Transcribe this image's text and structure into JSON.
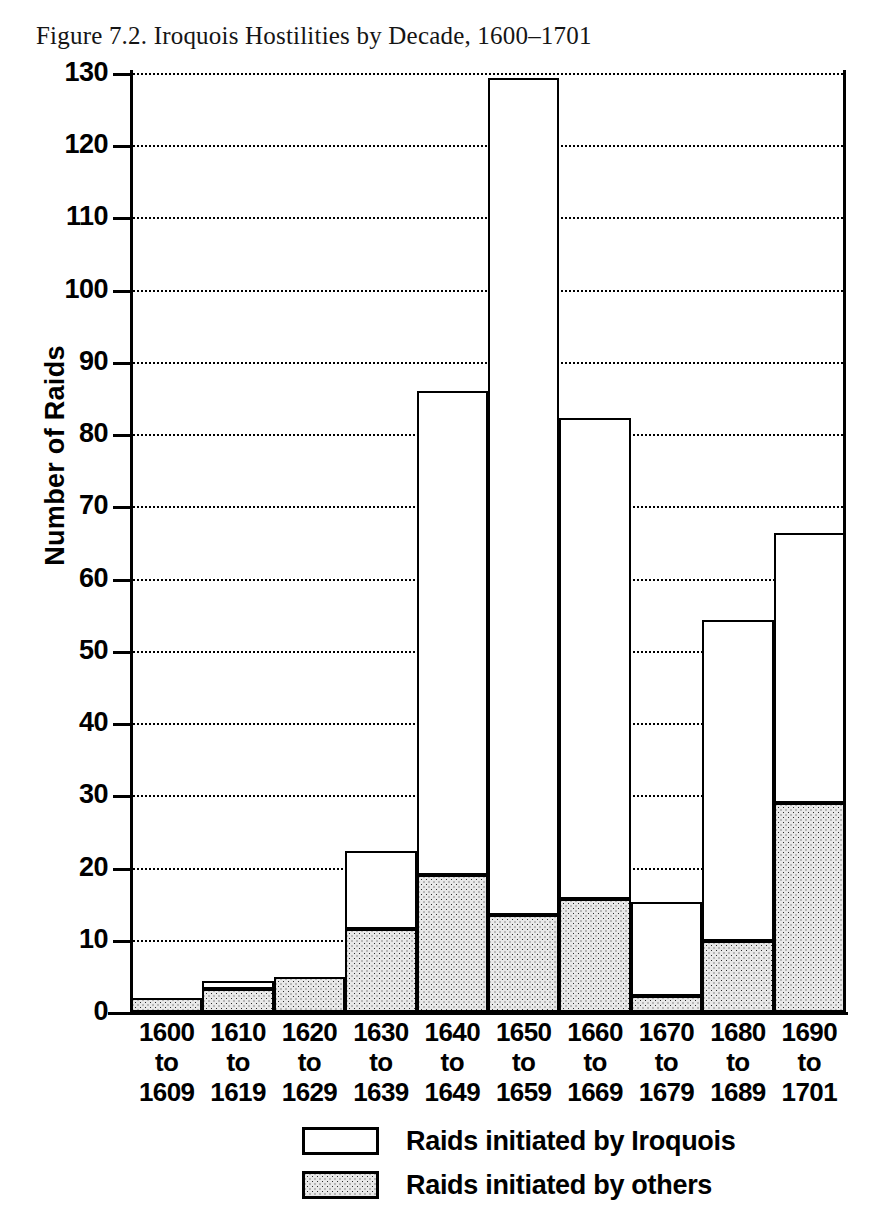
{
  "figure": {
    "title": "Figure 7.2. Iroquois Hostilities by Decade, 1600–1701"
  },
  "chart_data": {
    "type": "bar",
    "subtype": "stacked-bar",
    "title": "Figure 7.2. Iroquois Hostilities by Decade, 1600–1701",
    "xlabel": "",
    "ylabel": "Number of Raids",
    "ylim": [
      0,
      130
    ],
    "ytick_step": 10,
    "yticks": [
      0,
      10,
      20,
      30,
      40,
      50,
      60,
      70,
      80,
      90,
      100,
      110,
      120,
      130
    ],
    "ytick_labels": [
      "0",
      "10",
      "20",
      "30",
      "40",
      "50",
      "60",
      "70",
      "80",
      "90",
      "100",
      "110",
      "120",
      "130"
    ],
    "grid": "horizontal-dotted",
    "legend_position": "bottom-center",
    "categories": [
      "1600\nto\n1609",
      "1610\nto\n1619",
      "1620\nto\n1629",
      "1630\nto\n1639",
      "1640\nto\n1649",
      "1650\nto\n1659",
      "1660\nto\n1669",
      "1670\nto\n1679",
      "1680\nto\n1689",
      "1690\nto\n1701"
    ],
    "category_lines": [
      [
        "1600",
        "to",
        "1609"
      ],
      [
        "1610",
        "to",
        "1619"
      ],
      [
        "1620",
        "to",
        "1629"
      ],
      [
        "1630",
        "to",
        "1639"
      ],
      [
        "1640",
        "to",
        "1649"
      ],
      [
        "1650",
        "to",
        "1659"
      ],
      [
        "1660",
        "to",
        "1669"
      ],
      [
        "1670",
        "to",
        "1679"
      ],
      [
        "1680",
        "to",
        "1689"
      ],
      [
        "1690",
        "to",
        "1701"
      ]
    ],
    "series": [
      {
        "name": "Raids initiated by others",
        "fill": "stipple",
        "color": "#e8e8e8",
        "values": [
          2,
          3.2,
          4.8,
          11.5,
          19,
          13.5,
          15.7,
          2.2,
          9.8,
          29
        ]
      },
      {
        "name": "Raids initiated by Iroquois",
        "fill": "white",
        "color": "#ffffff",
        "values": [
          0,
          0.8,
          0,
          10.5,
          66.7,
          115.5,
          66.3,
          12.8,
          44.2,
          37
        ]
      }
    ],
    "totals": [
      2,
      4,
      4.8,
      22,
      85.7,
      129,
      82,
      15,
      54,
      66
    ],
    "legend": [
      {
        "label": "Raids initiated by Iroquois",
        "swatch": "white"
      },
      {
        "label": "Raids initiated by others",
        "swatch": "stipple"
      }
    ]
  }
}
